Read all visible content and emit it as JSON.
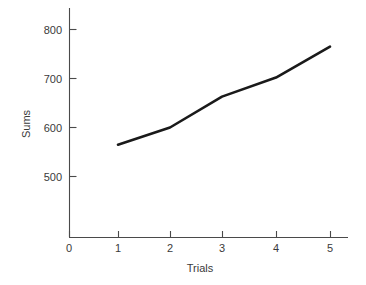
{
  "chart_data": {
    "type": "line",
    "title": "",
    "xlabel": "Trials",
    "ylabel": "Sums",
    "x": [
      1,
      2,
      3,
      4,
      5
    ],
    "values": [
      565,
      600,
      663,
      702,
      765
    ],
    "series": [
      {
        "name": "Sums",
        "values": [
          565,
          600,
          663,
          702,
          765
        ]
      }
    ],
    "xlim": [
      0,
      5.4
    ],
    "ylim": [
      430,
      820
    ],
    "xticks": [
      0,
      1,
      2,
      3,
      4,
      5
    ],
    "xtick_labels": [
      "0",
      "1",
      "2",
      "3",
      "4",
      "5"
    ],
    "yticks": [
      500,
      600,
      700,
      800
    ],
    "ytick_labels": [
      "500",
      "600",
      "700",
      "800"
    ],
    "grid": false,
    "legend": false,
    "legend_position": "none",
    "line_color": "#1a1a1a",
    "axis_color": "#4a4a4a",
    "background_color": "#ffffff"
  },
  "axes": {
    "x_axis_label": "Trials",
    "y_axis_label": "Sums"
  },
  "ticks": {
    "y": [
      {
        "label": "800",
        "value": 800
      },
      {
        "label": "700",
        "value": 700
      },
      {
        "label": "600",
        "value": 600
      },
      {
        "label": "500",
        "value": 500
      }
    ],
    "x": [
      {
        "label": "0",
        "value": 0
      },
      {
        "label": "1",
        "value": 1
      },
      {
        "label": "2",
        "value": 2
      },
      {
        "label": "3",
        "value": 3
      },
      {
        "label": "4",
        "value": 4
      },
      {
        "label": "5",
        "value": 5
      }
    ]
  }
}
